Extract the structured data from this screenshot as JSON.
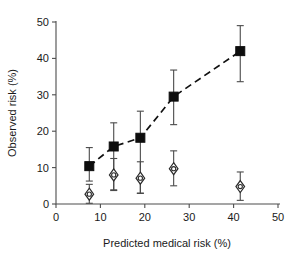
{
  "chart_data": {
    "type": "scatter",
    "title": "",
    "subtitle": "",
    "xlabel": "Predicted medical risk (%)",
    "ylabel": "Observed risk (%)",
    "xlim": [
      0,
      50
    ],
    "ylim": [
      0,
      50
    ],
    "xticks": [
      0,
      10,
      20,
      30,
      40,
      50
    ],
    "yticks": [
      0,
      10,
      20,
      30,
      40,
      50
    ],
    "xtick_labels": [
      "0",
      "10",
      "20",
      "30",
      "40",
      "50"
    ],
    "ytick_labels": [
      "0",
      "10",
      "20",
      "30",
      "40",
      "50"
    ],
    "grid": false,
    "legend": "none",
    "annotations": [
      {
        "kind": "dashed-trendline",
        "follows_series": "Observed risk (filled squares)"
      }
    ],
    "series": [
      {
        "name": "Observed risk (filled squares)",
        "marker": "filled-square",
        "color": "#0d0d0d",
        "connected_by": "dashed-line",
        "x": [
          7.5,
          13.0,
          19.0,
          26.5,
          41.5
        ],
        "values": [
          10.4,
          15.8,
          18.2,
          29.5,
          42.0
        ],
        "err_low": [
          6.3,
          3.9,
          3.0,
          21.8,
          33.6
        ],
        "err_high": [
          15.5,
          22.3,
          25.5,
          36.8,
          49.0
        ]
      },
      {
        "name": "Second outcome (open diamonds)",
        "marker": "open-diamond",
        "color": "#2b2b2b",
        "connected_by": "none",
        "x": [
          7.5,
          13.0,
          19.0,
          26.5,
          41.5
        ],
        "values": [
          2.7,
          8.0,
          7.1,
          9.7,
          4.8
        ],
        "err_low": [
          0.2,
          3.7,
          2.9,
          5.0,
          1.0
        ],
        "err_high": [
          5.4,
          12.5,
          11.6,
          14.6,
          8.8
        ]
      }
    ]
  }
}
